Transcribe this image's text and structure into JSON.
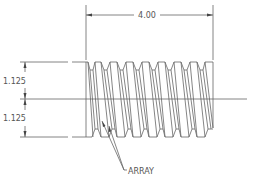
{
  "drawing": {
    "type": "threaded-rod-cad-drawing",
    "line_color": "#666666",
    "background": "#ffffff"
  },
  "dimensions": {
    "length": {
      "label": "4.00",
      "orientation": "horizontal"
    },
    "upper_radius": {
      "label": "1.125",
      "orientation": "vertical"
    },
    "lower_radius": {
      "label": "1.125",
      "orientation": "vertical"
    }
  },
  "annotations": {
    "leader_label": "ARRAY"
  },
  "geometry": {
    "thread_count": 8,
    "pitch_px": 16,
    "rod_left_x": 86,
    "rod_right_x": 213,
    "rod_top_y": 62,
    "rod_bottom_y": 137,
    "centerline_y": 99
  }
}
